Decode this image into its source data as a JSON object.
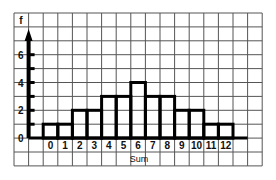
{
  "chart_data": {
    "type": "bar",
    "title": "",
    "xlabel": "Sum",
    "ylabel": "f",
    "categories": [
      "0",
      "1",
      "2",
      "3",
      "4",
      "5",
      "6",
      "7",
      "8",
      "9",
      "10",
      "11",
      "12"
    ],
    "values": [
      1,
      1,
      2,
      2,
      3,
      3,
      4,
      3,
      3,
      2,
      2,
      1,
      1
    ],
    "y_ticks": [
      "0",
      "2",
      "4",
      "6"
    ],
    "ylim": [
      0,
      7
    ],
    "grid": true,
    "legend": "none"
  }
}
